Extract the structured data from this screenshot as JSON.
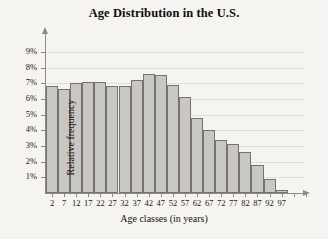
{
  "chart_data": {
    "type": "bar",
    "title": "Age Distribution in the U.S.",
    "xlabel": "Age classes (in years)",
    "ylabel": "Relative frequency",
    "categories": [
      "2",
      "7",
      "12",
      "17",
      "22",
      "27",
      "32",
      "37",
      "42",
      "47",
      "52",
      "57",
      "62",
      "67",
      "72",
      "77",
      "82",
      "87",
      "92",
      "97"
    ],
    "values": [
      6.8,
      6.6,
      7.0,
      7.1,
      7.1,
      6.8,
      6.8,
      7.2,
      7.6,
      7.5,
      6.9,
      6.1,
      4.8,
      4.0,
      3.4,
      3.1,
      2.6,
      1.8,
      0.9,
      0.2
    ],
    "value_suffix": "%",
    "ylim": [
      0,
      9.5
    ],
    "ytick_values": [
      1,
      2,
      3,
      4,
      5,
      6,
      7,
      8,
      9
    ],
    "ytick_labels": [
      "1%",
      "2%",
      "3%",
      "4%",
      "5%",
      "6%",
      "7%",
      "8%",
      "9%"
    ],
    "grid": true,
    "grid_axis": "y",
    "legend": false,
    "bar_color": "#c9c7c2",
    "bar_border_color": "#76736e",
    "axis_color": "#8d8a85",
    "grid_color": "#e2dfda",
    "background_color": "#f6f4f0",
    "text_color": "#15120f"
  }
}
